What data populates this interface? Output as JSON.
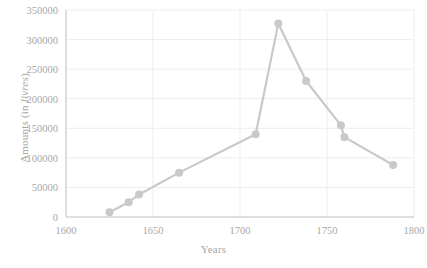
{
  "chart_data": {
    "type": "line",
    "title": "",
    "xlabel": "Years",
    "ylabel": "Amounts (in livres)",
    "ylabel_plain": "Amounts (in ",
    "ylabel_italic": "livres",
    "ylabel_tail": ")",
    "xlim": [
      1600,
      1800
    ],
    "ylim": [
      0,
      350000
    ],
    "grid": true,
    "legend": "none",
    "marker": "circle",
    "series_color": "#c9c9c9",
    "axis_color": "#bfbfbf",
    "grid_color": "#ededed",
    "text_color": "#a8a8a8",
    "x_ticks": [
      1600,
      1650,
      1700,
      1750,
      1800
    ],
    "x_tick_labels": [
      "1600",
      "1650",
      "1700",
      "1750",
      "1800"
    ],
    "y_ticks": [
      0,
      50000,
      100000,
      150000,
      200000,
      250000,
      300000,
      350000
    ],
    "y_tick_labels": [
      "0",
      "50000",
      "100000",
      "150000",
      "200000",
      "250000",
      "300000",
      "350000"
    ],
    "x": [
      1625,
      1636,
      1642,
      1665,
      1709,
      1722,
      1738,
      1758,
      1760,
      1788
    ],
    "values": [
      8000,
      25000,
      38000,
      75000,
      140000,
      327000,
      230000,
      155000,
      135000,
      88000
    ],
    "series": [
      {
        "name": "Amounts",
        "points": [
          {
            "x": 1625,
            "y": 8000
          },
          {
            "x": 1636,
            "y": 25000
          },
          {
            "x": 1642,
            "y": 38000
          },
          {
            "x": 1665,
            "y": 75000
          },
          {
            "x": 1709,
            "y": 140000
          },
          {
            "x": 1722,
            "y": 327000
          },
          {
            "x": 1738,
            "y": 230000
          },
          {
            "x": 1758,
            "y": 155000
          },
          {
            "x": 1760,
            "y": 135000
          },
          {
            "x": 1788,
            "y": 88000
          }
        ]
      }
    ]
  }
}
